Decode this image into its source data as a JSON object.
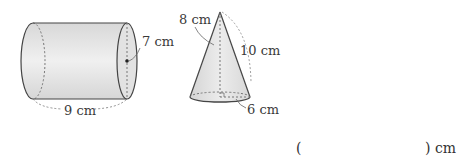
{
  "cylinder": {
    "diameter_label": "7 cm",
    "height_label": "9 cm"
  },
  "cone": {
    "height_label": "8 cm",
    "slant_label": "10 cm",
    "radius_label": "6 cm"
  },
  "answer": {
    "open_paren": "(",
    "close_paren_unit": ") cm",
    "value": ""
  },
  "colors": {
    "fill": "#e4e4e4",
    "stroke": "#444444",
    "dashed": "#777777"
  }
}
